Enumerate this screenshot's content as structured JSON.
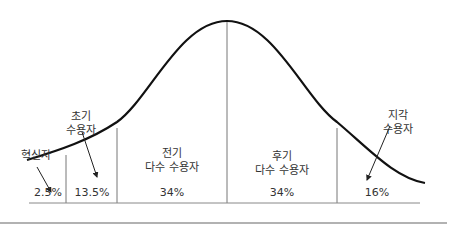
{
  "diagram": {
    "type": "adoption-bell-curve",
    "segments": [
      {
        "id": "innovators",
        "label_lines": [
          "혁신자"
        ],
        "percent": "2.5%"
      },
      {
        "id": "early-adopters",
        "label_lines": [
          "초기",
          "수용자"
        ],
        "percent": "13.5%"
      },
      {
        "id": "early-majority",
        "label_lines": [
          "전기",
          "다수 수용자"
        ],
        "percent": "34%"
      },
      {
        "id": "late-majority",
        "label_lines": [
          "후기",
          "다수 수용자"
        ],
        "percent": "34%"
      },
      {
        "id": "laggards",
        "label_lines": [
          "지각",
          "수용자"
        ],
        "percent": "16%"
      }
    ],
    "colors": {
      "curve": "#111111",
      "divider": "#777777",
      "baseline": "#888888",
      "rule": "#999999"
    }
  }
}
